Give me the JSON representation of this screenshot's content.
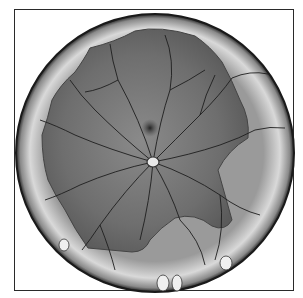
{
  "figure": {
    "corner_mark": "",
    "colors": {
      "frame": "#2a2a2a",
      "rim_light": "#d8d8d8",
      "rim_dark": "#3a3a3a",
      "retina": "#7a7a7a",
      "vessel": "#1e1e1e",
      "macula": "#2e2e2e",
      "optic_disc": "#e8e8e8"
    }
  }
}
